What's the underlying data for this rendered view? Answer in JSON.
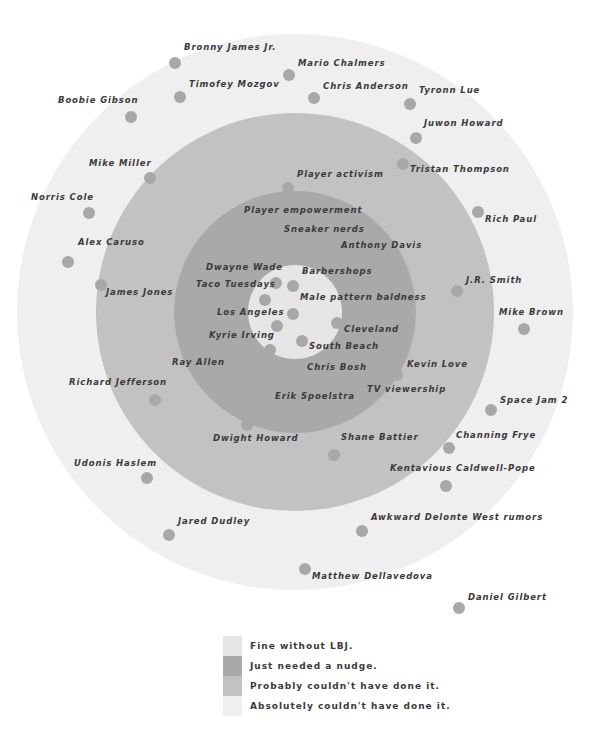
{
  "colors": {
    "outer": "#efefef",
    "probably": "#c2c2c2",
    "nudge": "#a9a9a9",
    "fine": "#e6e6e6",
    "dot": "#a8a8a8"
  },
  "chart_data": {
    "type": "bubble-ring",
    "title": "",
    "center": [
      295,
      312
    ],
    "rings": [
      {
        "name": "Absolutely couldn't have done it.",
        "radius": 278,
        "color": "#efefef"
      },
      {
        "name": "Probably couldn't have done it.",
        "radius": 199,
        "color": "#c2c2c2"
      },
      {
        "name": "Just needed a nudge.",
        "radius": 121,
        "color": "#a9a9a9"
      },
      {
        "name": "Fine without LBJ.",
        "radius": 47,
        "color": "#e6e6e6"
      }
    ],
    "points": [
      {
        "label": "Bronny James Jr.",
        "x": 175,
        "y": 63,
        "lx": 184,
        "ly": 48,
        "ring": "Absolutely couldn't have done it."
      },
      {
        "label": "Mario Chalmers",
        "x": 289,
        "y": 75,
        "lx": 298,
        "ly": 64,
        "ring": "Absolutely couldn't have done it."
      },
      {
        "label": "Timofey Mozgov",
        "x": 180,
        "y": 97,
        "lx": 189,
        "ly": 85,
        "ring": "Absolutely couldn't have done it."
      },
      {
        "label": "Chris Anderson",
        "x": 314,
        "y": 98,
        "lx": 323,
        "ly": 87,
        "ring": "Absolutely couldn't have done it."
      },
      {
        "label": "Tyronn Lue",
        "x": 410,
        "y": 104,
        "lx": 419,
        "ly": 91,
        "ring": "Absolutely couldn't have done it."
      },
      {
        "label": "Boobie Gibson",
        "x": 131,
        "y": 117,
        "lx": 58,
        "ly": 101,
        "ring": "Absolutely couldn't have done it."
      },
      {
        "label": "Juwon Howard",
        "x": 416,
        "y": 138,
        "lx": 424,
        "ly": 124,
        "ring": "Absolutely couldn't have done it."
      },
      {
        "label": "Tristan Thompson",
        "x": 403,
        "y": 164,
        "lx": 410,
        "ly": 170,
        "ring": "Probably couldn't have done it."
      },
      {
        "label": "Mike Miller",
        "x": 150,
        "y": 178,
        "lx": 89,
        "ly": 164,
        "ring": "Probably couldn't have done it."
      },
      {
        "label": "Player activism",
        "x": 288,
        "y": 188,
        "lx": 297,
        "ly": 175,
        "ring": "Probably couldn't have done it."
      },
      {
        "label": "Norris Cole",
        "x": 89,
        "y": 213,
        "lx": 31,
        "ly": 198,
        "ring": "Absolutely couldn't have done it."
      },
      {
        "label": "Rich Paul",
        "x": 478,
        "y": 212,
        "lx": 485,
        "ly": 220,
        "ring": "Absolutely couldn't have done it."
      },
      {
        "label": "Player empowerment",
        "x": null,
        "y": null,
        "lx": 244,
        "ly": 211,
        "ring": "Just needed a nudge."
      },
      {
        "label": "Sneaker nerds",
        "x": null,
        "y": null,
        "lx": 284,
        "ly": 230,
        "ring": "Just needed a nudge."
      },
      {
        "label": "Anthony Davis",
        "x": null,
        "y": null,
        "lx": 341,
        "ly": 246,
        "ring": "Just needed a nudge."
      },
      {
        "label": "Alex Caruso",
        "x": 68,
        "y": 262,
        "lx": 78,
        "ly": 243,
        "ring": "Absolutely couldn't have done it."
      },
      {
        "label": "Dwayne Wade",
        "x": 276,
        "y": 283,
        "lx": 206,
        "ly": 268,
        "ring": "Fine without LBJ."
      },
      {
        "label": "Barbershops",
        "x": 293,
        "y": 286,
        "lx": 302,
        "ly": 272,
        "ring": "Fine without LBJ."
      },
      {
        "label": "Taco Tuesdays",
        "x": 265,
        "y": 300,
        "lx": 196,
        "ly": 285,
        "ring": "Fine without LBJ."
      },
      {
        "label": "J.R. Smith",
        "x": 457,
        "y": 291,
        "lx": 466,
        "ly": 281,
        "ring": "Probably couldn't have done it."
      },
      {
        "label": "James Jones",
        "x": 101,
        "y": 285,
        "lx": 106,
        "ly": 293,
        "ring": "Probably couldn't have done it."
      },
      {
        "label": "Male pattern baldness",
        "x": 293,
        "y": 314,
        "lx": 300,
        "ly": 298,
        "ring": "Fine without LBJ."
      },
      {
        "label": "Los Angeles",
        "x": 277,
        "y": 326,
        "lx": 217,
        "ly": 313,
        "ring": "Fine without LBJ."
      },
      {
        "label": "Mike Brown",
        "x": 524,
        "y": 329,
        "lx": 499,
        "ly": 313,
        "ring": "Absolutely couldn't have done it."
      },
      {
        "label": "Cleveland",
        "x": 337,
        "y": 323,
        "lx": 344,
        "ly": 330,
        "ring": "Just needed a nudge."
      },
      {
        "label": "Kyrie Irving",
        "x": 270,
        "y": 350,
        "lx": 209,
        "ly": 336,
        "ring": "Just needed a nudge."
      },
      {
        "label": "South Beach",
        "x": 302,
        "y": 341,
        "lx": 309,
        "ly": 347,
        "ring": "Fine without LBJ."
      },
      {
        "label": "Ray Allen",
        "x": null,
        "y": null,
        "lx": 172,
        "ly": 363,
        "ring": "Probably couldn't have done it."
      },
      {
        "label": "Chris Bosh",
        "x": null,
        "y": null,
        "lx": 307,
        "ly": 368,
        "ring": "Just needed a nudge."
      },
      {
        "label": "Kevin Love",
        "x": 397,
        "y": 375,
        "lx": 407,
        "ly": 365,
        "ring": "Probably couldn't have done it."
      },
      {
        "label": "Richard Jefferson",
        "x": 155,
        "y": 400,
        "lx": 69,
        "ly": 383,
        "ring": "Probably couldn't have done it."
      },
      {
        "label": "TV viewership",
        "x": null,
        "y": null,
        "lx": 367,
        "ly": 390,
        "ring": "Probably couldn't have done it."
      },
      {
        "label": "Erik Spoelstra",
        "x": null,
        "y": null,
        "lx": 275,
        "ly": 397,
        "ring": "Just needed a nudge."
      },
      {
        "label": "Space Jam 2",
        "x": 491,
        "y": 410,
        "lx": 500,
        "ly": 401,
        "ring": "Absolutely couldn't have done it."
      },
      {
        "label": "Dwight Howard",
        "x": 247,
        "y": 425,
        "lx": 213,
        "ly": 439,
        "ring": "Probably couldn't have done it."
      },
      {
        "label": "Shane Battier",
        "x": 334,
        "y": 455,
        "lx": 341,
        "ly": 438,
        "ring": "Probably couldn't have done it."
      },
      {
        "label": "Channing Frye",
        "x": 449,
        "y": 448,
        "lx": 456,
        "ly": 436,
        "ring": "Absolutely couldn't have done it."
      },
      {
        "label": "Udonis Haslem",
        "x": 147,
        "y": 478,
        "lx": 74,
        "ly": 464,
        "ring": "Absolutely couldn't have done it."
      },
      {
        "label": "Kentavious Caldwell-Pope",
        "x": 446,
        "y": 486,
        "lx": 390,
        "ly": 469,
        "ring": "Absolutely couldn't have done it."
      },
      {
        "label": "Jared Dudley",
        "x": 169,
        "y": 535,
        "lx": 178,
        "ly": 522,
        "ring": "Absolutely couldn't have done it."
      },
      {
        "label": "Awkward Delonte West rumors",
        "x": 362,
        "y": 531,
        "lx": 371,
        "ly": 518,
        "ring": "Absolutely couldn't have done it."
      },
      {
        "label": "Matthew Dellavedova",
        "x": 305,
        "y": 569,
        "lx": 312,
        "ly": 577,
        "ring": "Absolutely couldn't have done it."
      },
      {
        "label": "Daniel Gilbert",
        "x": 459,
        "y": 608,
        "lx": 468,
        "ly": 598,
        "ring": "Absolutely couldn't have done it."
      }
    ]
  },
  "legend": {
    "items": [
      {
        "label": "Fine without LBJ.",
        "color": "#e6e6e6"
      },
      {
        "label": "Just needed a nudge.",
        "color": "#a9a9a9"
      },
      {
        "label": "Probably couldn't have done it.",
        "color": "#c2c2c2"
      },
      {
        "label": "Absolutely couldn't have done it.",
        "color": "#efefef"
      }
    ]
  }
}
